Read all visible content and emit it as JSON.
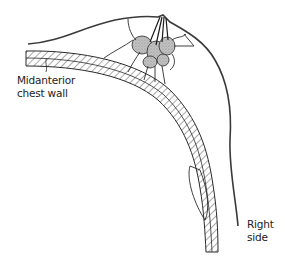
{
  "figure": {
    "type": "anatomical-cross-section",
    "colors": {
      "line": "#2a2a2a",
      "gland_fill": "#b8b8b8",
      "background": "#ffffff"
    }
  },
  "labels": {
    "midanterior": {
      "line1": "Midanterior",
      "line2": "chest wall"
    },
    "right_side": {
      "line1": "Right",
      "line2": "side"
    }
  }
}
